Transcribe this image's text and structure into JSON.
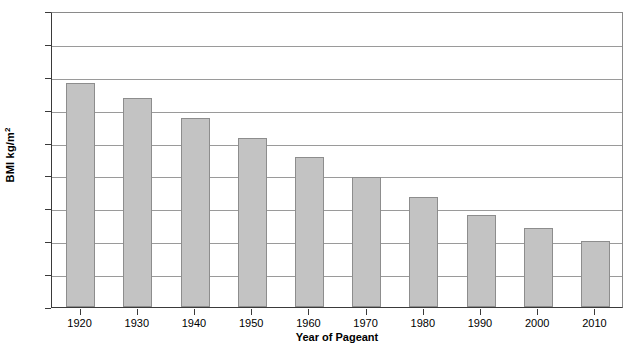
{
  "chart_data": {
    "type": "bar",
    "title": "",
    "xlabel": "Year of Pageant",
    "ylabel": "BMI kg/m",
    "ylabel_superscript": "2",
    "categories": [
      "1920",
      "1930",
      "1940",
      "1950",
      "1960",
      "1970",
      "1980",
      "1990",
      "2000",
      "2010"
    ],
    "values": [
      21.8,
      21.35,
      20.75,
      20.15,
      19.55,
      18.95,
      18.35,
      17.8,
      17.4,
      17.0
    ],
    "series": [
      {
        "name": "BMI of pageant winners",
        "values": [
          21.8,
          21.35,
          20.75,
          20.15,
          19.55,
          18.95,
          18.35,
          17.8,
          17.4,
          17.0
        ]
      }
    ],
    "ylim": [
      15,
      24
    ],
    "yticks": [
      "15",
      "16",
      "17",
      "18",
      "19",
      "20",
      "21",
      "22",
      "23",
      "24"
    ],
    "grid": true,
    "legend": "none",
    "bar_color": "#c3c3c3",
    "bar_border_color": "#8d8d8d",
    "gridline_color": "#9a9a9a",
    "axis_color": "#3a3a3a",
    "background_color": "#ffffff"
  }
}
